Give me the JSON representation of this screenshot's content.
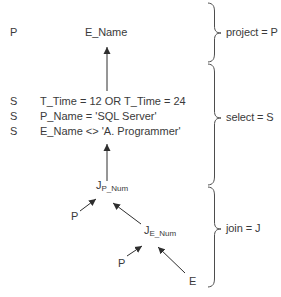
{
  "canvas": {
    "background": "#ffffff",
    "text_color": "#3a3a3a",
    "line_color": "#2e2e2e"
  },
  "tree": {
    "project": {
      "op": "P",
      "attr": "E_Name"
    },
    "selects": [
      {
        "op": "S",
        "condition": "T_Time = 12 OR T_Time = 24"
      },
      {
        "op": "S",
        "condition": "P_Name = 'SQL Server'"
      },
      {
        "op": "S",
        "condition": "E_Name <> 'A. Programmer'"
      }
    ],
    "joins": [
      {
        "op": "J",
        "sub": "P_Num"
      },
      {
        "op": "J",
        "sub": "E_Num"
      }
    ],
    "leaves": [
      {
        "label": "P"
      },
      {
        "label": "P"
      },
      {
        "label": "E"
      }
    ]
  },
  "legend": [
    {
      "label": "project = P"
    },
    {
      "label": "select = S"
    },
    {
      "label": "join = J"
    }
  ]
}
